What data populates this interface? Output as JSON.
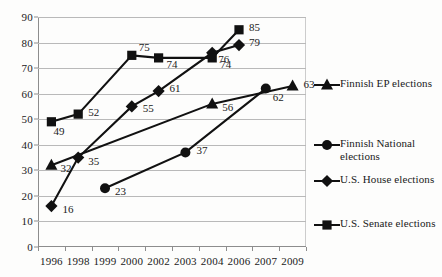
{
  "chart_data": {
    "type": "line",
    "title": "",
    "subtitle": "",
    "xlabel": "",
    "ylabel": "",
    "categories": [
      "1996",
      "1998",
      "1999",
      "2000",
      "2002",
      "2003",
      "2004",
      "2006",
      "2007",
      "2009"
    ],
    "ylim": [
      0,
      90
    ],
    "y_ticks": [
      0,
      10,
      20,
      30,
      40,
      50,
      60,
      70,
      80,
      90
    ],
    "y_tick_labels": [
      "0",
      "10",
      "20",
      "30",
      "40",
      "50",
      "60",
      "70",
      "80",
      "90"
    ],
    "grid": "horizontal",
    "legend_position": "right",
    "markers_labeled": true,
    "series": [
      {
        "name": "Finnish EP elections",
        "marker": "triangle",
        "color": "#111111",
        "points": [
          {
            "x": "1996",
            "y": 32,
            "label": "32"
          },
          {
            "x": "2004",
            "y": 56,
            "label": "56"
          },
          {
            "x": "2009",
            "y": 63,
            "label": "63"
          }
        ]
      },
      {
        "name": "Finnish National elections",
        "marker": "circle",
        "color": "#111111",
        "points": [
          {
            "x": "1999",
            "y": 23,
            "label": "23"
          },
          {
            "x": "2003",
            "y": 37,
            "label": "37"
          },
          {
            "x": "2007",
            "y": 62,
            "label": "62"
          }
        ]
      },
      {
        "name": "U.S. House elections",
        "marker": "diamond",
        "color": "#111111",
        "points": [
          {
            "x": "1996",
            "y": 16,
            "label": "16"
          },
          {
            "x": "1998",
            "y": 35,
            "label": "35"
          },
          {
            "x": "2000",
            "y": 55,
            "label": "55"
          },
          {
            "x": "2002",
            "y": 61,
            "label": "61"
          },
          {
            "x": "2004",
            "y": 76,
            "label": "76"
          },
          {
            "x": "2006",
            "y": 79,
            "label": "79"
          }
        ]
      },
      {
        "name": "U.S. Senate elections",
        "marker": "square",
        "color": "#111111",
        "points": [
          {
            "x": "1996",
            "y": 49,
            "label": "49"
          },
          {
            "x": "1998",
            "y": 52,
            "label": "52"
          },
          {
            "x": "2000",
            "y": 75,
            "label": "75"
          },
          {
            "x": "2002",
            "y": 74,
            "label": "74"
          },
          {
            "x": "2004",
            "y": 74,
            "label": "74"
          },
          {
            "x": "2006",
            "y": 85,
            "label": "85"
          }
        ]
      }
    ]
  },
  "legend": {
    "entries": [
      {
        "label": "Finnish EP elections",
        "marker": "triangle"
      },
      {
        "label": "Finnish National elections",
        "marker": "circle"
      },
      {
        "label": "U.S. House elections",
        "marker": "diamond"
      },
      {
        "label": "U.S. Senate elections",
        "marker": "square"
      }
    ]
  }
}
